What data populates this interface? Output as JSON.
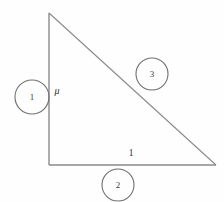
{
  "figure": {
    "kind": "right-triangle-diagram",
    "background_color": "#fefefe",
    "stroke_color": "#8a8a8a",
    "circle_stroke_color": "#6f6f6f",
    "text_color": "#2f2f2f"
  },
  "triangle": {
    "vertices": {
      "apex": {
        "x": 49,
        "y": 13
      },
      "bottom_left": {
        "x": 49,
        "y": 165
      },
      "bottom_right": {
        "x": 216,
        "y": 165
      }
    },
    "sides": [
      {
        "name": "vertical-leg",
        "label": "μ"
      },
      {
        "name": "base-leg",
        "label": "1"
      },
      {
        "name": "hypotenuse",
        "label": ""
      }
    ]
  },
  "side_labels": {
    "vertical_leg": "μ",
    "base_leg": "1"
  },
  "circled_nodes": [
    {
      "id": "node-1",
      "label": "1",
      "cx": 32,
      "cy": 97,
      "r": 17
    },
    {
      "id": "node-2",
      "label": "2",
      "cx": 118,
      "cy": 185,
      "r": 16
    },
    {
      "id": "node-3",
      "label": "3",
      "cx": 152,
      "cy": 74,
      "r": 16
    }
  ]
}
